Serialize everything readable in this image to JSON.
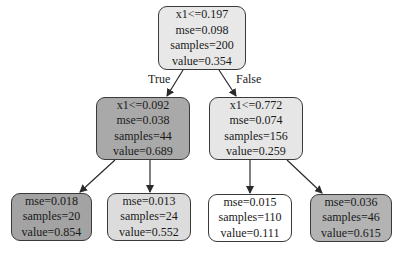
{
  "diagram": {
    "type": "decision-tree",
    "colors": {
      "root": "#e8e8e8",
      "left_mid": "#a9a9a9",
      "right_mid": "#e6e6e6",
      "leaf_1": "#a3a3a3",
      "leaf_2": "#dcdcdc",
      "leaf_3": "#ffffff",
      "leaf_4": "#b3b3b3",
      "border": "#3a3a3a",
      "edge": "#2a2a2a"
    },
    "edge_labels": {
      "true": "True",
      "false": "False"
    },
    "nodes": {
      "root": {
        "split": "x1<=0.197",
        "mse": "mse=0.098",
        "samples": "samples=200",
        "value": "value=0.354"
      },
      "left_mid": {
        "split": "x1<=0.092",
        "mse": "mse=0.038",
        "samples": "samples=44",
        "value": "value=0.689"
      },
      "right_mid": {
        "split": "x1<=0.772",
        "mse": "mse=0.074",
        "samples": "samples=156",
        "value": "value=0.259"
      },
      "leaf_1": {
        "mse": "mse=0.018",
        "samples": "samples=20",
        "value": "value=0.854"
      },
      "leaf_2": {
        "mse": "mse=0.013",
        "samples": "samples=24",
        "value": "value=0.552"
      },
      "leaf_3": {
        "mse": "mse=0.015",
        "samples": "samples=110",
        "value": "value=0.111"
      },
      "leaf_4": {
        "mse": "mse=0.036",
        "samples": "samples=46",
        "value": "value=0.615"
      }
    }
  }
}
